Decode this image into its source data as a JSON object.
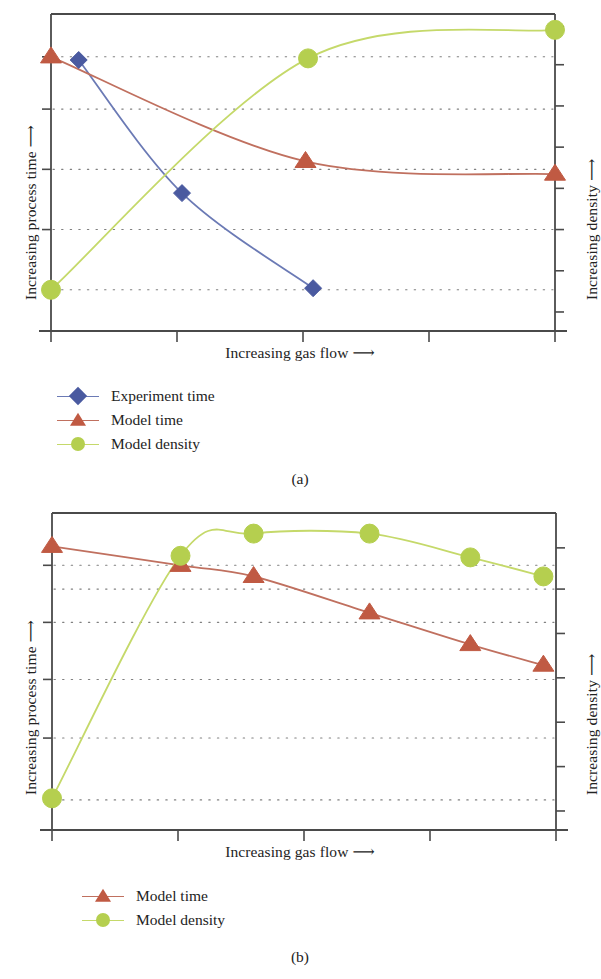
{
  "figure": {
    "width": 600,
    "height": 979,
    "background": "#ffffff"
  },
  "colors": {
    "experiment_time": "#4a5aa0",
    "model_time": "#c05a43",
    "model_density": "#b5cf4f",
    "model_time_line": "#c0705f",
    "model_density_line": "#c5d96a",
    "experiment_time_line": "#6b7ab5",
    "axis": "#4a4a4a",
    "gridline": "#6a6a6a",
    "text": "#232323"
  },
  "panel_a": {
    "caption": "(a)",
    "ylabel_left": "Increasing process time",
    "ylabel_right": "Increasing density",
    "xlabel": "Increasing gas flow",
    "arrow": "⟶",
    "legend": [
      {
        "label": "Experiment time",
        "marker": "diamond",
        "color": "#4a5aa0",
        "line_color": "#6b7ab5"
      },
      {
        "label": "Model time",
        "marker": "triangle",
        "color": "#c05a43",
        "line_color": "#c0705f"
      },
      {
        "label": "Model density",
        "marker": "circle",
        "color": "#b5cf4f",
        "line_color": "#c5d96a"
      }
    ]
  },
  "panel_b": {
    "caption": "(b)",
    "ylabel_left": "Increasing process time",
    "ylabel_right": "Increasing density",
    "xlabel": "Increasing gas flow",
    "arrow": "⟶",
    "legend": [
      {
        "label": "Model time",
        "marker": "triangle",
        "color": "#c05a43",
        "line_color": "#c0705f"
      },
      {
        "label": "Model density",
        "marker": "circle",
        "color": "#b5cf4f",
        "line_color": "#c5d96a"
      }
    ]
  },
  "chart_data": [
    {
      "id": "panel-a",
      "type": "line",
      "title": "",
      "subtitle": "(a)",
      "xlabel": "Increasing gas flow ⟶",
      "ylabel": "Increasing process time ⟶",
      "y2label": "Increasing density ⟶",
      "xlim": [
        0,
        10
      ],
      "ylim": [
        0,
        10
      ],
      "y2lim": [
        0,
        10
      ],
      "grid": true,
      "grid_style": "dotted-horizontal",
      "x_ticks": [
        0,
        2.5,
        5,
        7.5,
        10
      ],
      "x_tick_labels": [
        "",
        "",
        "",
        "",
        ""
      ],
      "y_ticks": [
        0,
        2,
        4,
        6,
        8,
        10
      ],
      "y_tick_labels": [
        "",
        "",
        "",
        "",
        "",
        ""
      ],
      "y2_ticks": [
        0,
        1.25,
        2.5,
        3.75,
        5,
        6.25,
        7.5,
        8.75,
        10
      ],
      "legend_position": "below-left",
      "series": [
        {
          "name": "Experiment time",
          "axis": "left",
          "marker": "diamond",
          "color": "#4a5aa0",
          "line_color": "#6b7ab5",
          "x": [
            0.55,
            2.6,
            5.2
          ],
          "y": [
            8.55,
            4.35,
            1.35
          ]
        },
        {
          "name": "Model time",
          "axis": "left",
          "marker": "triangle",
          "color": "#c05a43",
          "line_color": "#c0705f",
          "x": [
            0.0,
            5.05,
            10.0
          ],
          "y": [
            8.65,
            5.35,
            4.95
          ]
        },
        {
          "name": "Model density",
          "axis": "right",
          "marker": "circle",
          "color": "#b5cf4f",
          "line_color": "#c5d96a",
          "x": [
            0.0,
            5.1,
            10.0
          ],
          "y": [
            1.3,
            8.6,
            9.5
          ]
        }
      ]
    },
    {
      "id": "panel-b",
      "type": "line",
      "title": "",
      "subtitle": "(b)",
      "xlabel": "Increasing gas flow ⟶",
      "ylabel": "Increasing process time ⟶",
      "y2label": "Increasing density ⟶",
      "xlim": [
        0,
        10
      ],
      "ylim": [
        0,
        10
      ],
      "y2lim": [
        0,
        10
      ],
      "grid": true,
      "grid_style": "dotted-horizontal",
      "x_ticks": [
        0,
        2.5,
        5,
        7.5,
        10
      ],
      "x_tick_labels": [
        "",
        "",
        "",
        "",
        ""
      ],
      "y_ticks": [
        0,
        2,
        4,
        6,
        8,
        10
      ],
      "y_tick_labels": [
        "",
        "",
        "",
        "",
        "",
        ""
      ],
      "y2_ticks": [
        0,
        1.25,
        2.5,
        3.75,
        5,
        6.25,
        7.5,
        8.75,
        10
      ],
      "legend_position": "below-left",
      "series": [
        {
          "name": "Model time",
          "axis": "left",
          "marker": "triangle",
          "color": "#c05a43",
          "line_color": "#c0705f",
          "x": [
            0.0,
            2.55,
            4.0,
            6.3,
            8.3,
            9.75
          ],
          "y": [
            8.95,
            8.35,
            8.0,
            6.85,
            5.85,
            5.2
          ]
        },
        {
          "name": "Model density",
          "axis": "right",
          "marker": "circle",
          "color": "#b5cf4f",
          "line_color": "#c5d96a",
          "x": [
            0.0,
            2.55,
            4.0,
            6.3,
            8.3,
            9.75
          ],
          "y": [
            1.0,
            8.65,
            9.35,
            9.35,
            8.6,
            8.0
          ]
        }
      ]
    }
  ]
}
